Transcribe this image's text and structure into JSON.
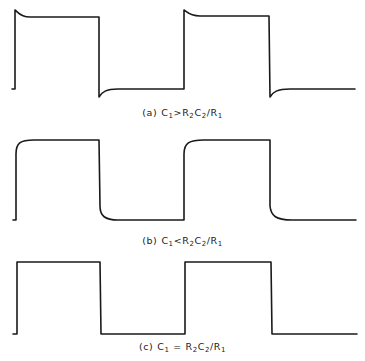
{
  "figure": {
    "panels": [
      {
        "id": "a",
        "label": "(a)",
        "condition": {
          "lhs": "C",
          "lhs_sub": "1",
          "op": ">",
          "r2": "R",
          "r2_sub": "2",
          "c2": "C",
          "c2_sub": "2",
          "slash": "/",
          "r1": "R",
          "r1_sub": "1"
        },
        "caption_text": "(a) C1>R2C2/R1",
        "description": "Overcompensated: square wave with overshoot spikes at each edge"
      },
      {
        "id": "b",
        "label": "(b)",
        "condition": {
          "lhs": "C",
          "lhs_sub": "1",
          "op": "<",
          "r2": "R",
          "r2_sub": "2",
          "c2": "C",
          "c2_sub": "2",
          "slash": "/",
          "r1": "R",
          "r1_sub": "1"
        },
        "caption_text": "(b) C1<R2C2/R1",
        "description": "Undercompensated: square wave with rounded leading corners"
      },
      {
        "id": "c",
        "label": "(c)",
        "condition": {
          "lhs": "C",
          "lhs_sub": "1",
          "op": " = ",
          "r2": "R",
          "r2_sub": "2",
          "c2": "C",
          "c2_sub": "2",
          "slash": "/",
          "r1": "R",
          "r1_sub": "1"
        },
        "caption_text": "(c) C1 = R2C2/R1",
        "description": "Correctly compensated: ideal square wave"
      }
    ],
    "stroke_color": "#1a1a1a",
    "background": "#ffffff"
  }
}
